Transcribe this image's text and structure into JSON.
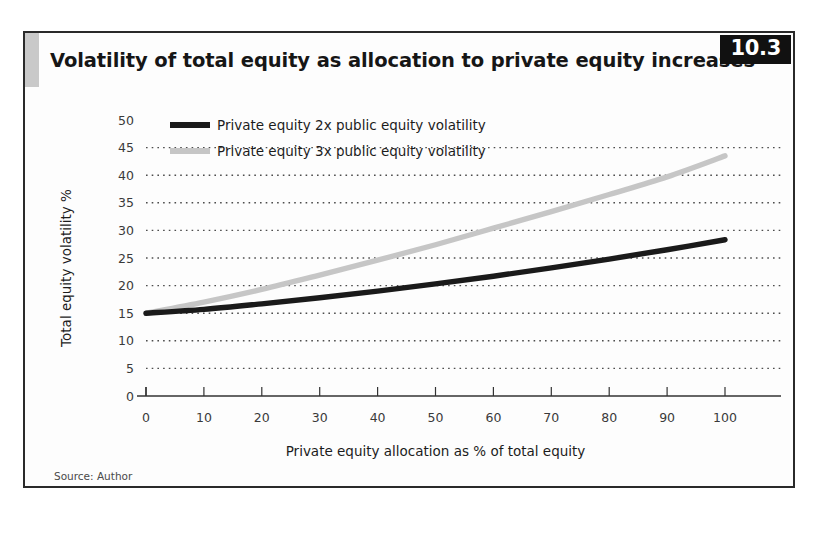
{
  "figure": {
    "number_badge": "10.3",
    "title": "Volatility of total equity as allocation to private equity increases",
    "source": "Source: Author"
  },
  "chart_data": {
    "type": "line",
    "title": "Volatility of total equity as allocation to private equity increases",
    "xlabel": "Private equity allocation as % of total equity",
    "ylabel": "Total equity volatility %",
    "xlim": [
      0,
      100
    ],
    "ylim": [
      0,
      50
    ],
    "xticks": [
      0,
      10,
      20,
      30,
      40,
      50,
      60,
      70,
      80,
      90,
      100
    ],
    "yticks": [
      0,
      5,
      10,
      15,
      20,
      25,
      30,
      35,
      40,
      45,
      50
    ],
    "grid": "horizontal-dotted",
    "legend_position": "top-left",
    "x": [
      0,
      10,
      20,
      30,
      40,
      50,
      60,
      70,
      80,
      90,
      100
    ],
    "series": [
      {
        "name": "Private equity 2x public equity volatility",
        "color": "#1a1a1a",
        "values": [
          15.0,
          15.7,
          16.7,
          17.8,
          19.0,
          20.3,
          21.7,
          23.2,
          24.8,
          26.5,
          28.3
        ]
      },
      {
        "name": "Private equity 3x public equity volatility",
        "color": "#c6c6c6",
        "values": [
          15.0,
          17.0,
          19.3,
          21.9,
          24.6,
          27.4,
          30.4,
          33.4,
          36.5,
          39.7,
          43.5
        ]
      }
    ]
  }
}
